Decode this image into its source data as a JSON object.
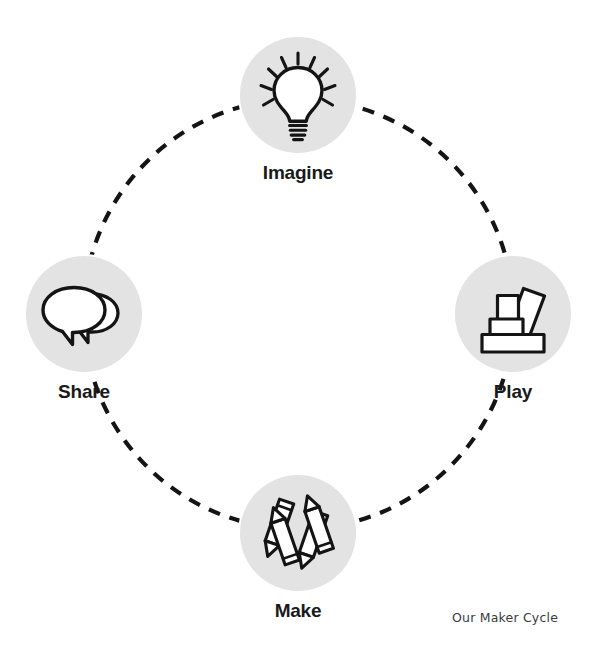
{
  "diagram": {
    "title": "Our Maker Cycle",
    "type": "cycle-diagram",
    "shape": "dashed-circle",
    "node_count": 4,
    "colors": {
      "disc_fill": "#e3e3e3",
      "stroke": "#141414",
      "label": "#1a1a1a",
      "caption": "#3b3b3b",
      "background": "#ffffff"
    },
    "connector": {
      "style": "dashed",
      "dash_length": 12,
      "gap_length": 10,
      "stroke_width": 4.2,
      "radius": 215
    },
    "nodes": [
      {
        "id": "imagine",
        "label": "Imagine",
        "icon": "lightbulb-icon",
        "position": "top",
        "order": 1,
        "cx": 298,
        "cy": 95
      },
      {
        "id": "play",
        "label": "Play",
        "icon": "building-blocks-icon",
        "position": "right",
        "order": 2,
        "cx": 513,
        "cy": 314
      },
      {
        "id": "make",
        "label": "Make",
        "icon": "crayons-icon",
        "position": "bottom",
        "order": 3,
        "cx": 298,
        "cy": 533
      },
      {
        "id": "share",
        "label": "Share",
        "icon": "speech-bubbles-icon",
        "position": "left",
        "order": 4,
        "cx": 84,
        "cy": 314
      }
    ]
  }
}
